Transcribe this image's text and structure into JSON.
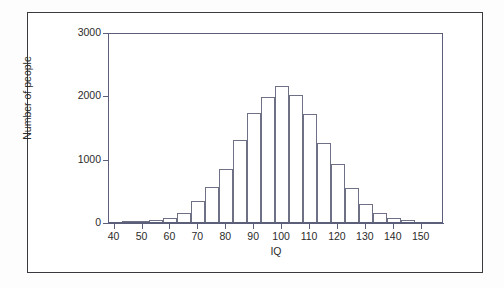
{
  "figure": {
    "frame_color": "#3a3a40",
    "axis_color": "#5b5f79",
    "bar_outline_color": "#6e7186",
    "background": "#ffffff"
  },
  "chart_data": {
    "type": "bar",
    "title": "",
    "subtitle": "",
    "xlabel": "IQ",
    "ylabel": "Number of people",
    "xlim": [
      38,
      158
    ],
    "ylim": [
      0,
      3000
    ],
    "grid": false,
    "legend": null,
    "bin_width": 5,
    "x_ticks": [
      40,
      50,
      60,
      70,
      80,
      90,
      100,
      110,
      120,
      130,
      140,
      150
    ],
    "x_tick_labels": [
      "40",
      "50",
      "60",
      "70",
      "80",
      "90",
      "100",
      "110",
      "120",
      "130",
      "140",
      "150"
    ],
    "y_ticks": [
      0,
      1000,
      2000,
      3000
    ],
    "y_tick_labels": [
      "0",
      "1000",
      "2000",
      "3000"
    ],
    "bin_centers": [
      45,
      50,
      55,
      60,
      65,
      70,
      75,
      80,
      85,
      90,
      95,
      100,
      105,
      110,
      115,
      120,
      125,
      130,
      135,
      140,
      145
    ],
    "bin_edges": [
      42.5,
      47.5,
      52.5,
      57.5,
      62.5,
      67.5,
      72.5,
      77.5,
      82.5,
      87.5,
      92.5,
      97.5,
      102.5,
      107.5,
      112.5,
      117.5,
      122.5,
      127.5,
      132.5,
      137.5,
      142.5,
      147.5
    ],
    "categories": [
      "42.5-47.5",
      "47.5-52.5",
      "52.5-57.5",
      "57.5-62.5",
      "62.5-67.5",
      "67.5-72.5",
      "72.5-77.5",
      "77.5-82.5",
      "82.5-87.5",
      "87.5-92.5",
      "92.5-97.5",
      "97.5-102.5",
      "102.5-107.5",
      "107.5-112.5",
      "112.5-117.5",
      "117.5-122.5",
      "122.5-127.5",
      "127.5-132.5",
      "132.5-137.5",
      "137.5-142.5",
      "142.5-147.5"
    ],
    "values": [
      0,
      10,
      30,
      70,
      150,
      330,
      550,
      840,
      1290,
      1720,
      1970,
      2150,
      2010,
      1710,
      1250,
      910,
      530,
      290,
      150,
      60,
      25
    ]
  },
  "axis": {
    "y_title": "Number of people",
    "x_title": "IQ"
  }
}
